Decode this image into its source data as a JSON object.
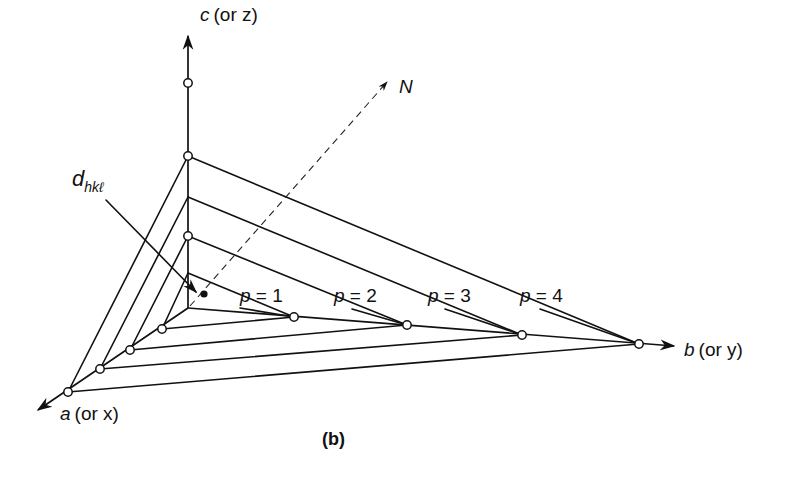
{
  "figure": {
    "caption": "(b)",
    "axes": {
      "c": {
        "name": "c",
        "paren": "(or z)"
      },
      "b": {
        "name": "b",
        "paren": "(or y)"
      },
      "a": {
        "name": "a",
        "paren": "(or x)"
      }
    },
    "normal_label": "N",
    "spacing_label": {
      "main": "d",
      "sub": "hkℓ"
    },
    "planes": [
      {
        "label": "p = 1"
      },
      {
        "label": "p = 2"
      },
      {
        "label": "p = 3"
      },
      {
        "label": "p = 4"
      }
    ]
  },
  "geometry": {
    "origin": [
      188,
      308
    ],
    "c_axis_end": [
      188,
      36
    ],
    "b_axis_end": [
      674,
      346
    ],
    "a_axis_end": [
      38,
      410
    ],
    "c_circles": [
      [
        188,
        83
      ],
      [
        188,
        156
      ],
      [
        188,
        236
      ]
    ],
    "planes": [
      {
        "c": [
          188,
          273
        ],
        "b": [
          294,
          317
        ],
        "a": [
          162,
          329
        ],
        "label_xy": [
          240,
          302
        ],
        "leader": [
          [
            240,
            308
          ],
          [
            294,
            317
          ]
        ],
        "c_to_label": [
          [
            188,
            273
          ],
          [
            236,
            295
          ]
        ]
      },
      {
        "c": [
          188,
          236
        ],
        "b": [
          407,
          325
        ],
        "a": [
          130,
          350
        ],
        "label_xy": [
          334,
          302
        ],
        "leader": [
          [
            352,
            309
          ],
          [
            407,
            325
          ]
        ],
        "c_to_label": [
          [
            188,
            236
          ],
          [
            330,
            295
          ]
        ]
      },
      {
        "c": [
          188,
          197
        ],
        "b": [
          522,
          335
        ],
        "a": [
          100,
          369
        ],
        "label_xy": [
          428,
          302
        ],
        "leader": [
          [
            445,
            309
          ],
          [
            522,
            335
          ]
        ],
        "c_to_label": [
          [
            188,
            197
          ],
          [
            424,
            295
          ]
        ]
      },
      {
        "c": [
          188,
          156
        ],
        "b": [
          639,
          344
        ],
        "a": [
          68,
          392
        ],
        "label_xy": [
          520,
          302
        ],
        "leader": [
          [
            540,
            309
          ],
          [
            639,
            344
          ]
        ],
        "c_to_label": [
          [
            188,
            156
          ],
          [
            516,
            295
          ]
        ]
      }
    ],
    "normal_line": [
      [
        190,
        306
      ],
      [
        387,
        82
      ]
    ],
    "d_dot": [
      204,
      294
    ],
    "d_leader": [
      [
        106,
        200
      ],
      [
        196,
        292
      ]
    ]
  }
}
